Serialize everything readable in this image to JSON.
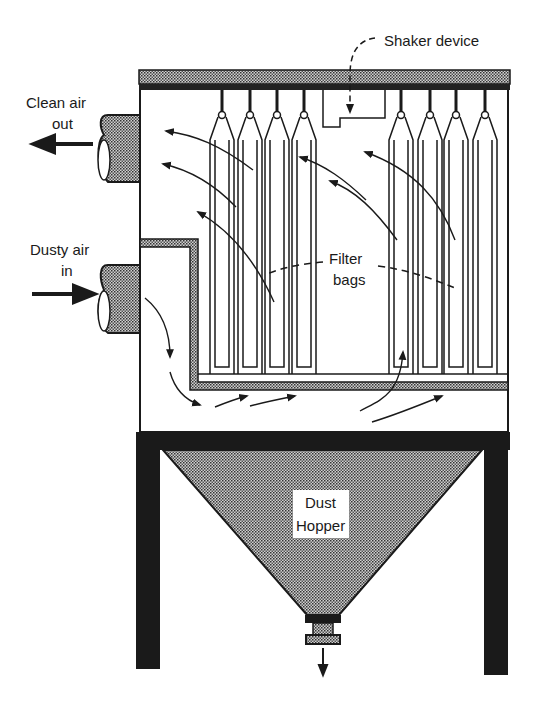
{
  "diagram": {
    "type": "baghouse-shaker-filter-schematic",
    "labels": {
      "shaker": "Shaker device",
      "clean_air_line1": "Clean air",
      "clean_air_line2": "out",
      "dusty_air_line1": "Dusty air",
      "dusty_air_line2": "in",
      "filter_line1": "Filter",
      "filter_line2": "bags",
      "hopper_line1": "Dust",
      "hopper_line2": "Hopper"
    },
    "components": {
      "filter_bag_count": 8,
      "left_bag_group": 4,
      "right_bag_group": 4
    },
    "colors": {
      "ink": "#1a1a1a",
      "stipple_fill": "#8a8a8a",
      "background": "#ffffff"
    }
  }
}
